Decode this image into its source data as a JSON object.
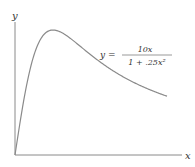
{
  "chart_data": {
    "type": "line",
    "title": "",
    "xlabel": "x",
    "ylabel": "y",
    "equation": {
      "lhs": "y =",
      "numerator": "10x",
      "denominator": "1 + .25x²"
    },
    "xlim": [
      0,
      8
    ],
    "ylim": [
      0,
      10.8
    ],
    "grid": false,
    "series": [
      {
        "name": "y = 10x/(1+.25x^2)",
        "x": [
          0,
          0.5,
          1,
          1.5,
          2,
          2.5,
          3,
          3.5,
          4,
          4.5,
          5,
          5.5,
          6,
          6.5,
          7,
          7.5,
          8
        ],
        "values": [
          0,
          4.71,
          8.0,
          9.6,
          10.0,
          9.76,
          9.23,
          8.62,
          8.0,
          7.42,
          6.9,
          6.42,
          6.0,
          5.62,
          5.28,
          4.98,
          4.71
        ]
      }
    ],
    "colors": {
      "curve": "#8a8a8a",
      "axes": "#8a8a8a",
      "text": "#333333"
    }
  }
}
